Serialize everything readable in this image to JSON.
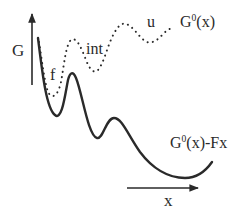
{
  "diagram": {
    "type": "energy-landscape",
    "axes": {
      "y_label": "G",
      "x_label": "x"
    },
    "curves": [
      {
        "name": "G0(x)",
        "label_base": "G",
        "label_sup": "0",
        "label_rest": "(x)",
        "style": "dotted",
        "states": [
          "f",
          "int",
          "u"
        ]
      },
      {
        "name": "G0(x)-Fx",
        "label_base": "G",
        "label_sup": "0",
        "label_rest": "(x)-Fx",
        "style": "solid"
      }
    ],
    "state_labels": {
      "folded": "f",
      "intermediate": "int",
      "unfolded": "u"
    },
    "colors": {
      "ink": "#2a2a2a",
      "background": "#ffffff"
    }
  }
}
